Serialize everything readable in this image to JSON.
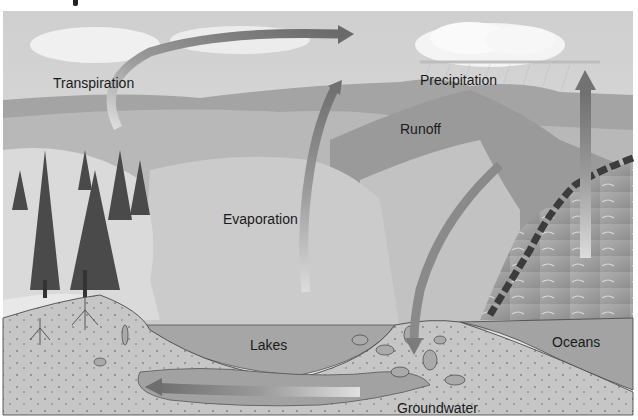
{
  "figure": {
    "style": "grayscale illustration",
    "labels": {
      "transpiration": "Transpiration",
      "precipitation": "Precipitation",
      "runoff": "Runoff",
      "evaporation": "Evaporation",
      "lakes": "Lakes",
      "oceans": "Oceans",
      "groundwater": "Groundwater"
    },
    "label_positions": {
      "transpiration": [
        53,
        76
      ],
      "precipitation": [
        420,
        73
      ],
      "runoff": [
        400,
        122
      ],
      "evaporation": [
        223,
        212
      ],
      "lakes": [
        250,
        338
      ],
      "oceans": [
        552,
        335
      ],
      "groundwater": [
        397,
        401
      ]
    },
    "arrows": [
      {
        "name": "transpiration-arrow",
        "from": "forest",
        "to": "sky",
        "direction": "up-then-right"
      },
      {
        "name": "evaporation-arrow",
        "from": "lake",
        "to": "sky",
        "direction": "up"
      },
      {
        "name": "ocean-evaporation-arrow",
        "from": "ocean",
        "to": "cloud",
        "direction": "up"
      },
      {
        "name": "precipitation-infiltration-arrow",
        "from": "mountains",
        "to": "ground",
        "direction": "down"
      },
      {
        "name": "groundwater-flow-arrow",
        "from": "right",
        "to": "left",
        "direction": "left"
      }
    ],
    "colors": {
      "sky": "#d9d9d9",
      "cloud": "#f2f2f2",
      "hills_dark": "#8f8f8f",
      "hills_mid": "#b4b4b4",
      "hills_light": "#d2d2d2",
      "lake": "#a8a8a8",
      "ocean": "#9c9c9c",
      "soil": "#c4c4c4",
      "arrow_dark": "#7a7a7a",
      "arrow_light": "#d8d8d8",
      "text": "#1a1a1a",
      "background": "#ffffff"
    }
  }
}
